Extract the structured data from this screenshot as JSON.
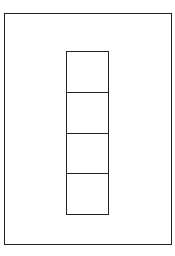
{
  "diagram": {
    "outer_frame": {
      "stroke": "#222222",
      "fill": "#ffffff"
    },
    "column": {
      "cell_count": 4,
      "stroke": "#222222",
      "cells": [
        {
          "index": 1,
          "label": ""
        },
        {
          "index": 2,
          "label": ""
        },
        {
          "index": 3,
          "label": ""
        },
        {
          "index": 4,
          "label": ""
        }
      ]
    }
  }
}
